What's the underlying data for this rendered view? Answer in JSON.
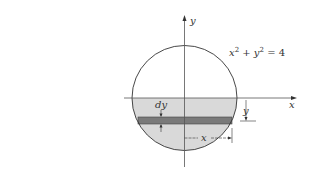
{
  "diagram": {
    "equation": {
      "base_x": "x",
      "exp_x": "2",
      "plus": " + ",
      "base_y": "y",
      "exp_y": "2",
      "rhs": " = 4"
    },
    "axes": {
      "x_label": "x",
      "y_label": "y"
    },
    "labels": {
      "dy": "dy",
      "y_dim": "y",
      "x_dim": "x"
    },
    "colors": {
      "line": "#333333",
      "region_fill": "#d9d9d9",
      "strip_fill": "#7a7a7a",
      "axis": "#555555"
    }
  }
}
